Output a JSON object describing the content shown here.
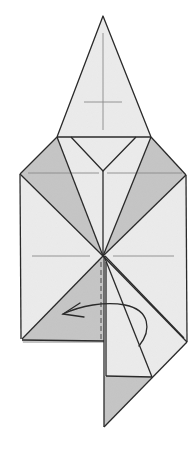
{
  "diagram": {
    "type": "origami-fold-step",
    "colors": {
      "paper_light": "#ececec",
      "paper_shaded": "#c4c4c4",
      "line": "#2a2a2a",
      "crease": "#8a8a8a",
      "background": "#ffffff"
    },
    "instruction_arrow": {
      "kind": "curved-fold-arrow",
      "direction": "right-to-left"
    },
    "valley_fold": "dashed vertical line"
  }
}
